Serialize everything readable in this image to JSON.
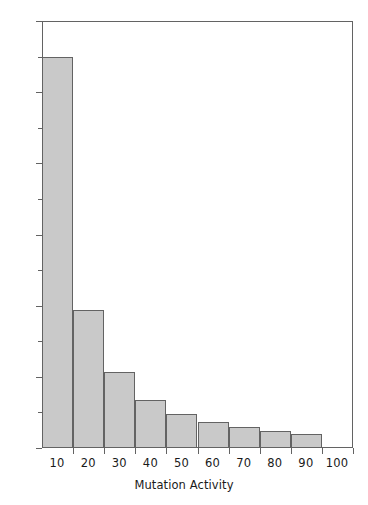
{
  "chart_data": {
    "type": "bar",
    "title": "",
    "subtitle": "",
    "xlabel": "Mutation Activity",
    "ylabel": "",
    "categories": [
      "0-10",
      "10-20",
      "20-30",
      "30-40",
      "40-50",
      "50-60",
      "60-70",
      "70-80",
      "80-90",
      "90-100"
    ],
    "bin_edges": [
      0,
      10,
      20,
      30,
      40,
      50,
      60,
      70,
      80,
      90,
      100
    ],
    "values": [
      55.0,
      19.4,
      10.7,
      6.8,
      4.8,
      3.7,
      2.9,
      2.4,
      2.0,
      0
    ],
    "xlim": [
      0,
      100
    ],
    "ylim": [
      0,
      60
    ],
    "x_ticks": [
      10,
      20,
      30,
      40,
      50,
      60,
      70,
      80,
      90,
      100
    ],
    "x_tick_labels": [
      "10",
      "20",
      "30",
      "40",
      "50",
      "60",
      "70",
      "80",
      "90",
      "100"
    ],
    "y_ticks_major": [
      0,
      10,
      20,
      30,
      40,
      50,
      60
    ],
    "y_tick_labels": [
      "0",
      "10",
      "20",
      "30",
      "40",
      "50",
      "60"
    ],
    "y_ticks_minor": [
      5,
      15,
      25,
      35,
      45,
      55
    ],
    "grid": false,
    "legend": false,
    "legend_position": "none",
    "bar_fill_color": "#c9c9c9",
    "bar_edge_color": "#636363",
    "axis_color": "#636363",
    "background_color": "#ffffff",
    "text_color": "#1a1a1a"
  }
}
